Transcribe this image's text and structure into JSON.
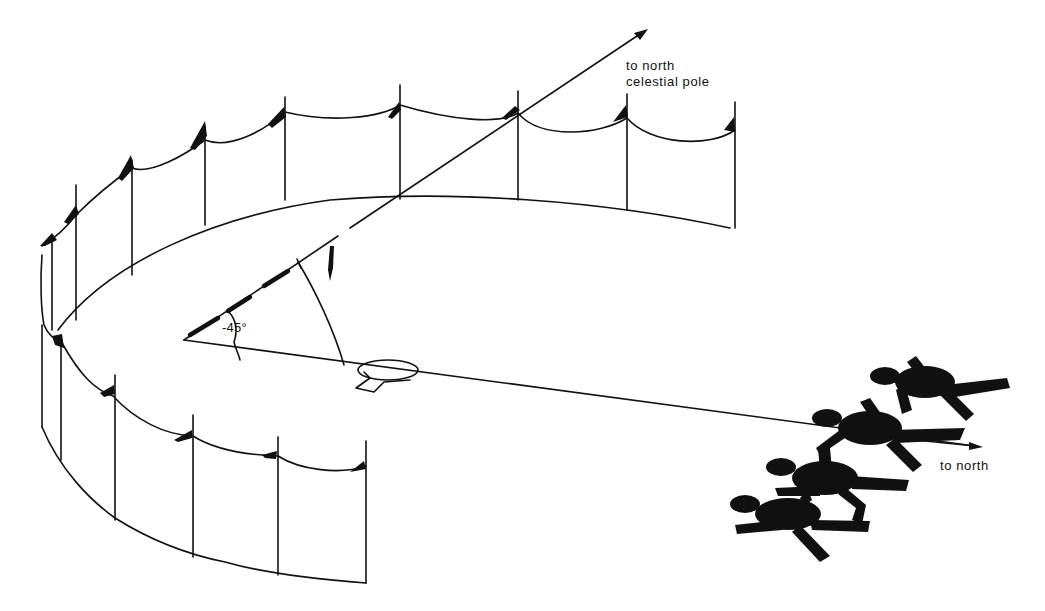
{
  "diagram": {
    "colors": {
      "background": "#ffffff",
      "ink": "#111111"
    },
    "labels": {
      "celestial_pole_line1": "to north",
      "celestial_pole_line2": "celestial pole",
      "north": "to north",
      "angle": "-45°"
    },
    "elements": {
      "arrow_celestial_pole": "celestial-pole-axis",
      "arrow_north": "north-axis",
      "enclosure_back_posts": 8,
      "enclosure_front_posts": 6,
      "observer_figures": 4
    }
  }
}
